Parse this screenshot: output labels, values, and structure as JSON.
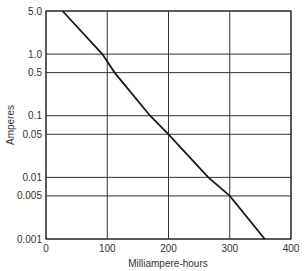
{
  "chart_data": {
    "type": "line",
    "title": "",
    "xlabel": "Milliampere-hours",
    "ylabel": "Amperes",
    "xscale": "linear",
    "yscale": "log",
    "xlim": [
      0,
      400
    ],
    "ylim": [
      0.001,
      5.0
    ],
    "x_ticks": [
      0,
      100,
      200,
      300,
      400
    ],
    "x_tick_labels": [
      "0",
      "100",
      "200",
      "300",
      "400"
    ],
    "y_ticks": [
      5.0,
      1.0,
      0.5,
      0.1,
      0.05,
      0.01,
      0.005,
      0.001
    ],
    "y_tick_labels": [
      "5.0",
      "1.0",
      "0.5",
      "0.1",
      "0.05",
      "0.01",
      "0.005",
      "0.001"
    ],
    "grid": true,
    "legend": null,
    "series": [
      {
        "name": "discharge",
        "x": [
          27,
          92,
          112,
          170,
          200,
          265,
          300,
          357
        ],
        "y": [
          5.0,
          1.0,
          0.5,
          0.1,
          0.05,
          0.01,
          0.005,
          0.001
        ]
      }
    ]
  },
  "layout": {
    "plot_left": 46,
    "plot_right": 291,
    "plot_top": 11,
    "plot_bottom": 239,
    "grid_color": "#333333",
    "line_color": "#1a1a1a"
  }
}
